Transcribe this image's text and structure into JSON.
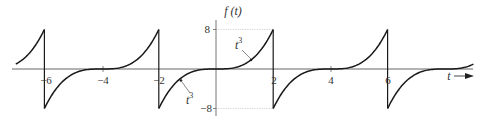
{
  "chart_data": {
    "type": "line",
    "title": "",
    "xlabel": "t",
    "ylabel": "f(t)",
    "function": "f(t) = t^3 for -2 <= t < 2, periodic with period 4",
    "period": 4,
    "xlim": [
      -7,
      9
    ],
    "ylim": [
      -8,
      8
    ],
    "x_ticks": [
      -6,
      -4,
      -2,
      2,
      4,
      6
    ],
    "x_tick_labels": [
      "-6",
      "-4",
      "-2",
      "2",
      "4",
      "6"
    ],
    "y_ticks": [
      8,
      -8
    ],
    "y_tick_labels": [
      "8",
      "−8"
    ],
    "grid": false,
    "series": [
      {
        "name": "f(t)",
        "segments": [
          {
            "t": [
              -7,
              -6.5,
              -6.2,
              -6
            ],
            "f": [
              -1,
              3.375,
              5.83,
              8
            ]
          },
          {
            "t": [
              -6,
              -5.5,
              -5,
              -4.5,
              -4,
              -3.5,
              -3,
              -2.5,
              -2
            ],
            "f": [
              -8,
              -3.375,
              -1,
              -0.125,
              0,
              0.125,
              1,
              3.375,
              8
            ]
          },
          {
            "t": [
              -2,
              -1.5,
              -1,
              -0.5,
              0,
              0.5,
              1,
              1.5,
              2
            ],
            "f": [
              -8,
              -3.375,
              -1,
              -0.125,
              0,
              0.125,
              1,
              3.375,
              8
            ]
          },
          {
            "t": [
              2,
              2.5,
              3,
              3.5,
              4,
              4.5,
              5,
              5.5,
              6
            ],
            "f": [
              -8,
              -3.375,
              -1,
              -0.125,
              0,
              0.125,
              1,
              3.375,
              8
            ]
          },
          {
            "t": [
              6,
              6.5,
              7,
              7.5,
              8,
              8.5,
              9
            ],
            "f": [
              -8,
              -3.375,
              -1,
              -0.125,
              0,
              0.125,
              1
            ]
          }
        ]
      }
    ],
    "annotations": [
      {
        "text": "t³",
        "base": "t",
        "exp": "3",
        "points_to": {
          "t": 1.2,
          "f": 1.73
        }
      },
      {
        "text": "t³",
        "base": "t",
        "exp": "3",
        "points_to": {
          "t": -1.25,
          "f": -1.95
        }
      }
    ],
    "reference_lines": [
      {
        "type": "dotted-horizontal",
        "f": 8,
        "t_range": [
          0,
          2
        ]
      },
      {
        "type": "dotted-horizontal",
        "f": -8,
        "t_range": [
          0,
          2
        ]
      }
    ]
  },
  "labels": {
    "y_axis_label": "f (t)",
    "x_axis_label": "t",
    "tick_neg6": "−6",
    "tick_neg4": "−4",
    "tick_neg2": "−2",
    "tick_2": "2",
    "tick_4": "4",
    "tick_6": "6",
    "tick_8": "8",
    "tick_neg8": "−8",
    "annot_upper_base": "t",
    "annot_upper_exp": "3",
    "annot_lower_base": "t",
    "annot_lower_exp": "3"
  },
  "colors": {
    "curve": "#1a1a1a",
    "axis": "#555555",
    "dotted": "#bbbbbb",
    "text": "#333333"
  }
}
